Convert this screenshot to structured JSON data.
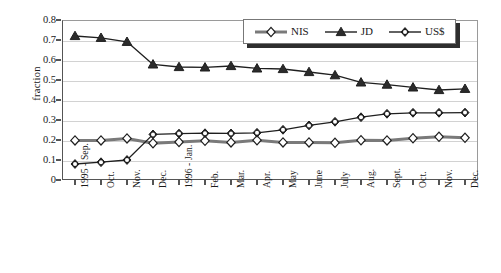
{
  "chart_data": {
    "type": "line",
    "title": "",
    "xlabel": "",
    "ylabel": "fraction",
    "ylim": [
      0,
      0.8
    ],
    "ytick_values": [
      0.8,
      0.7,
      0.6,
      0.5,
      0.4,
      0.3,
      0.2,
      0.1,
      0
    ],
    "ytick_labels": [
      "0.8",
      "0.7",
      "0.6",
      "0.5",
      "0.4",
      "0.3",
      "0.2",
      "0.1",
      "0"
    ],
    "grid": true,
    "legend_position": "top-right",
    "categories": [
      "1995 - Sep.",
      "Oct.",
      "Nov.",
      "Dec.",
      "1996 - Jan.",
      "Feb.",
      "Mar.",
      "Apr.",
      "May",
      "June",
      "July",
      "Aug.",
      "Sept.",
      "Oct.",
      "Nov.",
      "Dec."
    ],
    "series": [
      {
        "name": "NIS",
        "marker": "open-diamond",
        "color": "#7a7a7a",
        "values": [
          0.198,
          0.198,
          0.208,
          0.184,
          0.19,
          0.196,
          0.188,
          0.199,
          0.188,
          0.188,
          0.186,
          0.199,
          0.198,
          0.209,
          0.216,
          0.211
        ]
      },
      {
        "name": "JD",
        "marker": "filled-triangle",
        "color": "#1f1f1f",
        "values": [
          0.72,
          0.711,
          0.691,
          0.578,
          0.565,
          0.563,
          0.57,
          0.558,
          0.555,
          0.54,
          0.524,
          0.488,
          0.477,
          0.463,
          0.45,
          0.456
        ]
      },
      {
        "name": "US$",
        "marker": "circle-x",
        "color": "#1f1f1f",
        "values": [
          0.08,
          0.089,
          0.1,
          0.228,
          0.232,
          0.234,
          0.233,
          0.236,
          0.251,
          0.273,
          0.291,
          0.314,
          0.331,
          0.336,
          0.336,
          0.337
        ]
      }
    ]
  }
}
